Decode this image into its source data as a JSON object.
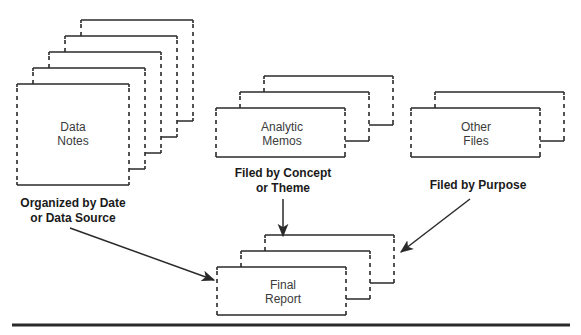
{
  "colors": {
    "ink": "#2a2a2a",
    "background": "#ffffff",
    "label_text": "#3a3a3a",
    "caption_text": "#1a1a1a"
  },
  "stacks": [
    {
      "id": "data-notes",
      "label_lines": [
        "Data",
        "Notes"
      ],
      "pages": 5,
      "front": {
        "x": 17,
        "y": 84,
        "w": 112,
        "h": 101
      },
      "offset": {
        "dx": 16,
        "dy": -16
      },
      "label_center": {
        "x": 73,
        "y1": 131,
        "y2": 145
      }
    },
    {
      "id": "analytic-memos",
      "label_lines": [
        "Analytic",
        "Memos"
      ],
      "pages": 3,
      "front": {
        "x": 216,
        "y": 108,
        "w": 129,
        "h": 49
      },
      "offset": {
        "dx": 24,
        "dy": -16
      },
      "label_center": {
        "x": 282,
        "y1": 131,
        "y2": 145
      }
    },
    {
      "id": "other-files",
      "label_lines": [
        "Other",
        "Files"
      ],
      "pages": 2,
      "front": {
        "x": 411,
        "y": 108,
        "w": 129,
        "h": 49
      },
      "offset": {
        "dx": 24,
        "dy": -16
      },
      "label_center": {
        "x": 476,
        "y1": 131,
        "y2": 145
      }
    },
    {
      "id": "final-report",
      "label_lines": [
        "Final",
        "Report"
      ],
      "pages": 3,
      "front": {
        "x": 217,
        "y": 267,
        "w": 129,
        "h": 48
      },
      "offset": {
        "dx": 24,
        "dy": -16
      },
      "label_center": {
        "x": 283,
        "y1": 289,
        "y2": 303
      }
    }
  ],
  "captions": [
    {
      "id": "organized-by-date",
      "lines": [
        "Organized by Date",
        "or Data Source"
      ],
      "x": 73,
      "y1": 207,
      "y2": 222
    },
    {
      "id": "filed-by-concept",
      "lines": [
        "Filed by Concept",
        "or Theme"
      ],
      "x": 283,
      "y1": 177,
      "y2": 192
    },
    {
      "id": "filed-by-purpose",
      "lines": [
        "Filed by Purpose"
      ],
      "x": 478,
      "y1": 189
    }
  ],
  "arrows": [
    {
      "id": "arrow-data-notes-to-report",
      "from": [
        70,
        228
      ],
      "to": [
        214,
        280
      ]
    },
    {
      "id": "arrow-memos-to-report",
      "from": [
        283,
        199
      ],
      "to": [
        283,
        236
      ]
    },
    {
      "id": "arrow-other-to-report",
      "from": [
        470,
        199
      ],
      "to": [
        401,
        252
      ]
    }
  ],
  "rule": {
    "x1": 12,
    "x2": 570,
    "y": 325,
    "thickness": 3
  }
}
